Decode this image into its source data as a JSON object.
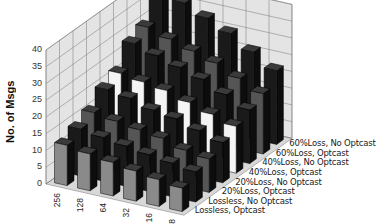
{
  "chart_data": {
    "type": "bar",
    "subtype": "3d-bar",
    "title": "",
    "xlabel": "",
    "ylabel": "No. of Msgs",
    "ylim": [
      0,
      40
    ],
    "yticks": [
      0,
      5,
      10,
      15,
      20,
      25,
      30,
      35,
      40
    ],
    "grid": true,
    "categories": [
      "256",
      "128",
      "64",
      "32",
      "16",
      "8"
    ],
    "series": [
      {
        "name": "Lossless, Optcast",
        "values": [
          12,
          11,
          10,
          9,
          8,
          7
        ]
      },
      {
        "name": "Lossless, No Optcast",
        "values": [
          14,
          13,
          12,
          11,
          10,
          9
        ]
      },
      {
        "name": "20%Loss, Optcast",
        "values": [
          16,
          15,
          14,
          13,
          11,
          10
        ]
      },
      {
        "name": "20%Loss, No Optcast",
        "values": [
          20,
          19,
          17,
          16,
          14,
          12
        ]
      },
      {
        "name": "40%Loss, Optcast",
        "values": [
          22,
          21,
          20,
          18,
          16,
          14
        ]
      },
      {
        "name": "40%Loss, No Optcast",
        "values": [
          28,
          26,
          24,
          22,
          19,
          16
        ]
      },
      {
        "name": "60%Loss, Optcast",
        "values": [
          30,
          28,
          26,
          24,
          21,
          18
        ]
      },
      {
        "name": "60%Loss, No Optcast",
        "values": [
          40,
          36,
          33,
          30,
          26,
          22
        ]
      }
    ],
    "legend_position": "depth-axis-right"
  },
  "labels": {
    "ylabel": "No. of Msgs",
    "series": [
      "60%Loss, No Optcast",
      "60%Loss, Optcast",
      "40%Loss, No Optcast",
      "40%Loss, Optcast",
      "20%Loss, No Optcast",
      "20%Loss, Optcast",
      "Lossless, No Optcast",
      "Lossless, Optcast"
    ],
    "xticks": [
      "256",
      "128",
      "64",
      "32",
      "16",
      "8"
    ],
    "yticks": [
      "0",
      "5",
      "10",
      "15",
      "20",
      "25",
      "30",
      "35",
      "40"
    ]
  },
  "colors": {
    "wall": "#e4e4e4",
    "grid": "#777777",
    "bar_dark": "#1a1a1a",
    "bar_mid": "#555555",
    "bar_light": "#f4f4f4",
    "bar_gray": "#8a8a8a"
  }
}
